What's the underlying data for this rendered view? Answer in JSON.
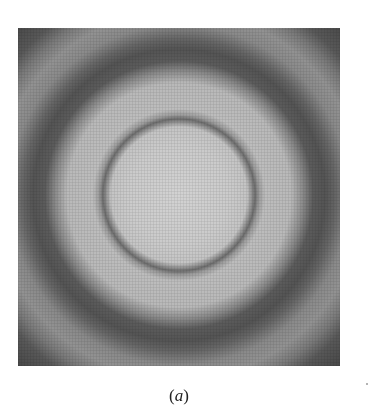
{
  "figure": {
    "panel_label_open": "(",
    "panel_label_letter": "a",
    "panel_label_close": ")",
    "rings": {
      "center_px": [
        179,
        195
      ],
      "inner_thin_dark_ring_radius_px": 76,
      "outer_dark_band_radius_px": 140,
      "corner_dark_region_radius_px": 225
    },
    "colors": {
      "center": "#d2d2d2",
      "inner_ring": "#6e6e6e",
      "dark_band": "#545454",
      "corner": "#444444",
      "background": "#ffffff"
    }
  }
}
